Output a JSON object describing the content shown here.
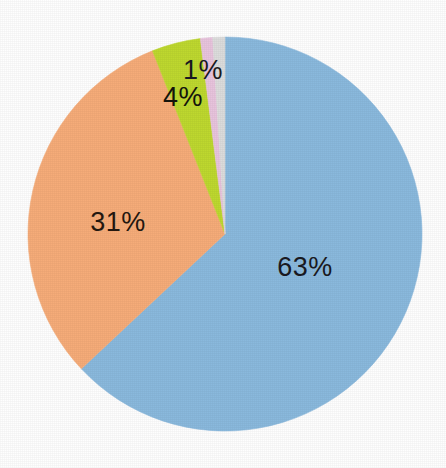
{
  "chart_data": {
    "type": "pie",
    "title": "",
    "subtitle": "",
    "xlabel": "",
    "ylabel": "",
    "legend": "none",
    "grid": false,
    "labels_shown": true,
    "label_format": "percent",
    "start_angle_deg": 0,
    "direction": "clockwise",
    "categories": [
      "63%",
      "31%",
      "4%",
      "1%",
      ""
    ],
    "values": [
      63,
      31,
      4,
      1,
      0.5
    ],
    "slices": [
      {
        "name": "slice-blue",
        "label": "63%",
        "value": 63,
        "color": "#8ab9dd",
        "label_color": "#1a1a22",
        "label_x": 305,
        "label_y": 267,
        "start_deg": 0,
        "end_deg": 226.8
      },
      {
        "name": "slice-orange",
        "label": "31%",
        "value": 31,
        "color": "#f6ac79",
        "label_color": "#241810",
        "label_x": 118,
        "label_y": 222,
        "start_deg": 226.8,
        "end_deg": 338.4
      },
      {
        "name": "slice-green",
        "label": "4%",
        "value": 4,
        "color": "#bed82f",
        "label_color": "#14140c",
        "label_x": 183,
        "label_y": 97,
        "start_deg": 338.4,
        "end_deg": 352.8
      },
      {
        "name": "slice-pink",
        "label": "1%",
        "value": 1,
        "color": "#e8c4dd",
        "label_color": "#1a1a22",
        "label_x": 203,
        "label_y": 70,
        "start_deg": 352.8,
        "end_deg": 356.4
      },
      {
        "name": "slice-gray",
        "label": "",
        "value": 0.5,
        "color": "#dcdcdc",
        "label_color": "#1a1a22",
        "label_x": 0,
        "label_y": 0,
        "start_deg": 356.4,
        "end_deg": 360
      }
    ],
    "geometry": {
      "center_x": 225,
      "center_y": 234,
      "radius": 197
    },
    "background_color": "#fefefe"
  }
}
